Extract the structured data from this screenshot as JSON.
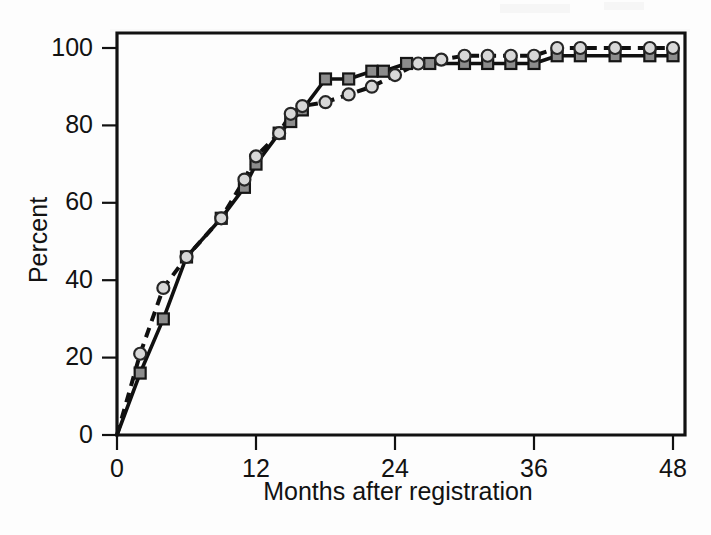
{
  "figure": {
    "background_color": "#fdfdfd",
    "axis_color": "#111111",
    "width": 711,
    "height": 535
  },
  "chart_data": {
    "type": "line",
    "title": "",
    "subtitle": "",
    "xlabel": "Months after registration",
    "ylabel": "Percent",
    "xlim": [
      0,
      48
    ],
    "ylim": [
      0,
      104
    ],
    "xticks": [
      0,
      12,
      24,
      36,
      48
    ],
    "xticklabels": [
      "0",
      "12",
      "24",
      "36",
      "48"
    ],
    "yticks": [
      0,
      20,
      40,
      60,
      80,
      100
    ],
    "yticklabels": [
      "0",
      "20",
      "40",
      "60",
      "80",
      "100"
    ],
    "grid": false,
    "legend": null,
    "legend_position": "none",
    "annotations": [],
    "series": [
      {
        "name": "solid-square-series",
        "linestyle": "solid",
        "marker": "square",
        "marker_fill": "#8c8c8c",
        "marker_edge": "#151515",
        "line_color": "#101010",
        "x": [
          0,
          2,
          4,
          6,
          9,
          11,
          12,
          14,
          15,
          16,
          18,
          20,
          22,
          23,
          25,
          27,
          30,
          32,
          34,
          36,
          38,
          40,
          43,
          46,
          48
        ],
        "y": [
          0,
          16,
          30,
          46,
          56,
          64,
          70,
          78,
          81,
          84,
          92,
          92,
          94,
          94,
          96,
          96,
          96,
          96,
          96,
          96,
          98,
          98,
          98,
          98,
          98
        ]
      },
      {
        "name": "dashed-circle-series",
        "linestyle": "dashed",
        "marker": "circle",
        "marker_fill": "#d8d8d8",
        "marker_edge": "#262626",
        "line_color": "#101010",
        "x": [
          0,
          2,
          4,
          6,
          9,
          11,
          12,
          14,
          15,
          16,
          18,
          20,
          22,
          24,
          26,
          28,
          30,
          32,
          34,
          36,
          38,
          40,
          43,
          46,
          48
        ],
        "y": [
          0,
          21,
          38,
          46,
          56,
          66,
          72,
          78,
          83,
          85,
          86,
          88,
          90,
          93,
          96,
          97,
          98,
          98,
          98,
          98,
          100,
          100,
          100,
          100,
          100
        ]
      }
    ]
  },
  "axes": {
    "y_label": "Percent",
    "x_label": "Months after registration"
  }
}
